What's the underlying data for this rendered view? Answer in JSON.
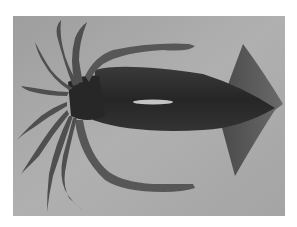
{
  "image": {
    "subject": "squid",
    "description": "Grayscale photograph of a squid viewed from above on a gray background, tentacles to the left, triangular fins to the right",
    "colors": {
      "page_background": "#ffffff",
      "photo_background": "#a9a9a9",
      "body": "#2f2f2f",
      "head": "#262626",
      "fin": "#5e5e5e",
      "arms": "#555555",
      "highlight": "#e8e8e8"
    }
  }
}
